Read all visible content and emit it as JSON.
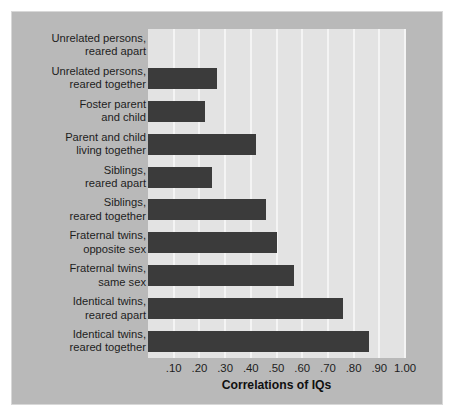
{
  "chart_data": {
    "type": "bar",
    "orientation": "horizontal",
    "title": "",
    "xlabel": "Correlations of IQs",
    "ylabel": "",
    "xlim": [
      0,
      1.0
    ],
    "grid": true,
    "legend": null,
    "categories": [
      "Unrelated persons,\nreared apart",
      "Unrelated persons,\nreared together",
      "Foster parent\nand child",
      "Parent and child\nliving together",
      "Siblings,\nreared apart",
      "Siblings,\nreared together",
      "Fraternal twins,\nopposite sex",
      "Fraternal twins,\nsame sex",
      "Identical twins,\nreared apart",
      "Identical twins,\nreared together"
    ],
    "values": [
      0.0,
      0.27,
      0.22,
      0.42,
      0.25,
      0.46,
      0.5,
      0.57,
      0.76,
      0.86
    ],
    "xticks": [
      0.1,
      0.2,
      0.3,
      0.4,
      0.5,
      0.6,
      0.7,
      0.8,
      0.9,
      1.0
    ],
    "xtick_labels": [
      ".10",
      ".20",
      ".30",
      ".40",
      ".50",
      ".60",
      ".70",
      ".80",
      ".90",
      "1.00"
    ],
    "colors": {
      "bar": "#3b3b3b",
      "plot_background": "#e3e3e3",
      "figure_background": "#b9b9b9",
      "gridline": "#f4f4f4",
      "text": "#1d1d1d"
    }
  }
}
